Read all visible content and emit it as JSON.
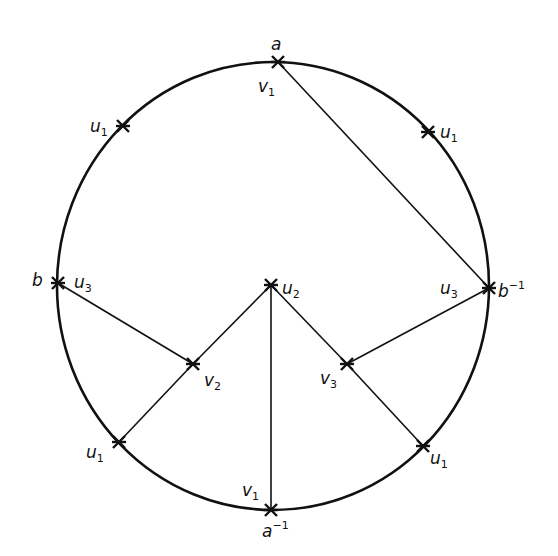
{
  "diagram": {
    "type": "polygon-identification-circle",
    "circle": {
      "cx": 273,
      "cy": 286,
      "rx": 216,
      "ry": 224
    },
    "stroke_color": "#111111",
    "vertices": [
      {
        "id": "a",
        "x": 278,
        "y": 62
      },
      {
        "id": "a_inv",
        "x": 271,
        "y": 510
      },
      {
        "id": "b",
        "x": 58,
        "y": 283
      },
      {
        "id": "b_inv",
        "x": 489,
        "y": 288
      },
      {
        "id": "u1_tl",
        "x": 123,
        "y": 126
      },
      {
        "id": "u1_tr",
        "x": 428,
        "y": 132
      },
      {
        "id": "u1_bl",
        "x": 119,
        "y": 442
      },
      {
        "id": "u1_br",
        "x": 423,
        "y": 446
      },
      {
        "id": "u2",
        "x": 271,
        "y": 285
      },
      {
        "id": "v2",
        "x": 193,
        "y": 364
      },
      {
        "id": "v3",
        "x": 347,
        "y": 364
      }
    ],
    "edges": [
      [
        "a",
        "b_inv"
      ],
      [
        "b",
        "v2"
      ],
      [
        "v2",
        "u2"
      ],
      [
        "v2",
        "u1_bl"
      ],
      [
        "u2",
        "a_inv"
      ],
      [
        "u2",
        "v3"
      ],
      [
        "v3",
        "u1_br"
      ],
      [
        "v3",
        "b_inv"
      ]
    ],
    "labels": {
      "a": {
        "base": "a",
        "sub": "",
        "sup": ""
      },
      "a_v1": {
        "base": "v",
        "sub": "1",
        "sup": ""
      },
      "a_inv": {
        "base": "a",
        "sub": "",
        "sup": "−1"
      },
      "a_inv_v1": {
        "base": "v",
        "sub": "1",
        "sup": ""
      },
      "b": {
        "base": "b",
        "sub": "",
        "sup": ""
      },
      "b_u3": {
        "base": "u",
        "sub": "3",
        "sup": ""
      },
      "b_inv": {
        "base": "b",
        "sub": "",
        "sup": "−1"
      },
      "b_inv_u3": {
        "base": "u",
        "sub": "3",
        "sup": ""
      },
      "u1_tl": {
        "base": "u",
        "sub": "1",
        "sup": ""
      },
      "u1_tr": {
        "base": "u",
        "sub": "1",
        "sup": ""
      },
      "u1_bl": {
        "base": "u",
        "sub": "1",
        "sup": ""
      },
      "u1_br": {
        "base": "u",
        "sub": "1",
        "sup": ""
      },
      "u2": {
        "base": "u",
        "sub": "2",
        "sup": ""
      },
      "v2": {
        "base": "v",
        "sub": "2",
        "sup": ""
      },
      "v3": {
        "base": "v",
        "sub": "3",
        "sup": ""
      }
    }
  }
}
